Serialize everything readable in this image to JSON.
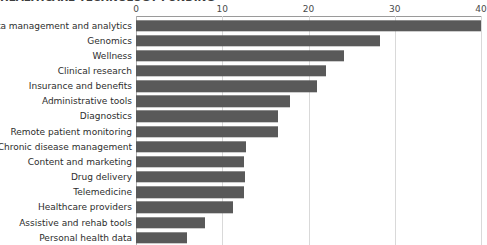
{
  "chart_data": {
    "type": "bar",
    "orientation": "horizontal",
    "title": "HEALTHCARE TECHNOLOGY FUNDING",
    "xlabel": "",
    "ylabel": "",
    "xlim": [
      0,
      40
    ],
    "xticks": [
      0,
      10,
      20,
      30,
      40
    ],
    "xtick_labels": [
      "0",
      "10",
      "20",
      "30",
      "40"
    ],
    "grid": true,
    "legend": false,
    "bar_color": "#595959",
    "categories": [
      "Data management and analytics",
      "Genomics",
      "Wellness",
      "Clinical research",
      "Insurance and benefits",
      "Administrative tools",
      "Diagnostics",
      "Remote patient monitoring",
      "Chronic disease management",
      "Content and marketing",
      "Drug delivery",
      "Telemedicine",
      "Healthcare providers",
      "Assistive and rehab tools",
      "Personal health data"
    ],
    "values": [
      40,
      28.3,
      24.1,
      22.0,
      21.0,
      17.9,
      16.5,
      16.5,
      12.7,
      12.5,
      12.6,
      12.5,
      11.2,
      8.0,
      5.9
    ]
  }
}
